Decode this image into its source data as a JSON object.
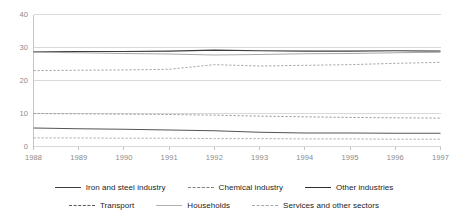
{
  "chart_data": {
    "type": "line",
    "title": "",
    "xlabel": "",
    "ylabel": "",
    "ylim": [
      0,
      40
    ],
    "yticks": [
      0,
      10,
      20,
      30,
      40
    ],
    "grid": true,
    "legend_position": "bottom",
    "categories": [
      "1988",
      "1989",
      "1990",
      "1991",
      "1992",
      "1993",
      "1994",
      "1995",
      "1996",
      "1997"
    ],
    "series": [
      {
        "name": "Iron and steel industry",
        "style": "solid",
        "color": "#555555",
        "values": [
          5.6,
          5.4,
          5.2,
          5.0,
          4.8,
          4.3,
          4.1,
          4.1,
          4.0,
          4.0
        ]
      },
      {
        "name": "Chemical industry",
        "style": "dashed",
        "color": "#9a9a9a",
        "values": [
          23.0,
          23.1,
          23.2,
          23.4,
          24.8,
          24.4,
          24.6,
          24.8,
          25.2,
          25.5
        ]
      },
      {
        "name": "Other industries",
        "style": "solid",
        "color": "#3c3c3c",
        "values": [
          28.7,
          28.8,
          28.8,
          28.9,
          29.2,
          29.0,
          28.9,
          28.9,
          29.0,
          28.9
        ]
      },
      {
        "name": "Transport",
        "style": "dashed",
        "color": "#8f8f8f",
        "values": [
          10.0,
          9.9,
          9.8,
          9.7,
          9.5,
          9.2,
          9.0,
          8.8,
          8.7,
          8.6
        ]
      },
      {
        "name": "Households",
        "style": "solid",
        "color": "#a8a8a8",
        "values": [
          28.6,
          28.4,
          28.2,
          28.0,
          27.7,
          27.9,
          28.1,
          28.2,
          28.4,
          28.6
        ]
      },
      {
        "name": "Services and other sectors",
        "style": "dashed",
        "color": "#a0a0a0",
        "values": [
          2.6,
          2.6,
          2.5,
          2.5,
          2.4,
          2.4,
          2.3,
          2.3,
          2.2,
          2.2
        ]
      }
    ]
  },
  "axes": {
    "y_labels": [
      "40",
      "30",
      "20",
      "10",
      "0"
    ],
    "x_labels": [
      "1988",
      "1989",
      "1990",
      "1991",
      "1992",
      "1993",
      "1994",
      "1995",
      "1996",
      "1997"
    ]
  },
  "legend": {
    "row1": [
      {
        "label": "Iron and steel industry",
        "style": "solid",
        "color": "#3c3c3c"
      },
      {
        "label": "Chemical industry",
        "style": "dashed",
        "color": "#7f7f7f"
      },
      {
        "label": "Other industries",
        "style": "solid",
        "color": "#2e2e2e"
      }
    ],
    "row2": [
      {
        "label": "Transport",
        "style": "dashed",
        "color": "#5a5a5a"
      },
      {
        "label": "Households",
        "style": "solid",
        "color": "#b0b0b0"
      },
      {
        "label": "Services and other sectors",
        "style": "dashed",
        "color": "#a8a8a8"
      }
    ]
  },
  "colors": {
    "grid": "#d9d9d9",
    "axis": "#c4c4c4",
    "tick_text": "#8a8a8a",
    "legend_text": "#1c1c1c",
    "background": "#ffffff"
  }
}
